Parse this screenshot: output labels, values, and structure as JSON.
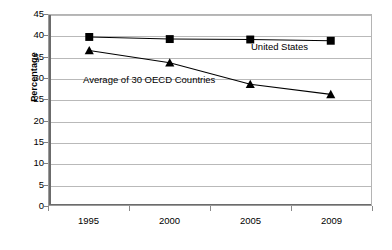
{
  "chart_data": {
    "type": "line",
    "title": "",
    "subtitle": "",
    "xlabel": "",
    "ylabel": "Percentage",
    "categories": [
      "1995",
      "2000",
      "2005",
      "2009"
    ],
    "x_tick_labels": [
      "1995",
      "2000",
      "2005",
      "2009"
    ],
    "y_tick_labels": [
      "0",
      "5",
      "10",
      "15",
      "20",
      "25",
      "30",
      "35",
      "40",
      "45"
    ],
    "y_tick_values": [
      0,
      5,
      10,
      15,
      20,
      25,
      30,
      35,
      40,
      45
    ],
    "ylim": [
      0,
      45
    ],
    "grid": "horizontal",
    "legend_position": "inline-annotations",
    "series": [
      {
        "name": "United States",
        "marker": "square",
        "color": "#000000",
        "values": [
          39.8,
          39.3,
          39.2,
          38.9
        ]
      },
      {
        "name": "Average of 30 OECD Countries",
        "marker": "triangle",
        "color": "#000000",
        "values": [
          36.6,
          33.7,
          28.6,
          26.2
        ]
      }
    ],
    "annotations": [
      {
        "text": "United States",
        "series": "United States"
      },
      {
        "text": "Average of 30 OECD Countries",
        "series": "Average of 30 OECD Countries"
      }
    ]
  },
  "axis": {
    "y_title": "Percentage"
  },
  "colors": {
    "series_line": "#000000",
    "gridline": "#b9b9b9",
    "axis": "#6b6b6b",
    "plot_background": "#ffffff",
    "text": "#000000"
  }
}
